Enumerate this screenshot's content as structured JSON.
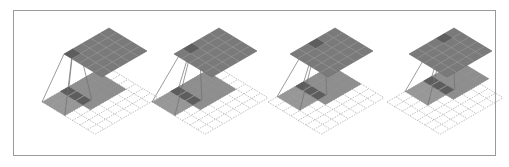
{
  "diagram": {
    "type": "convolution-animation-frames",
    "panel_count": 4,
    "output_grid": {
      "rows": 5,
      "cols": 5,
      "color": "#7a7a7a",
      "highlight_color": "#5e5e5e",
      "line_color": "#9a9a9a"
    },
    "input_grid": {
      "rows": 7,
      "cols": 7,
      "line_color": "#b0b0b0",
      "dashed": true
    },
    "kernel": {
      "size": 3,
      "fill": "#8c8c8c",
      "overlap_fill": "#5a5a5a"
    },
    "shaded_region": {
      "size": 4,
      "fill": "#7a7a7a"
    },
    "connector_color": "#707070",
    "frame_border": "#9a9a9a",
    "panels": [
      {
        "id": 1,
        "offset_x": 0,
        "kernel_col": 0,
        "kernel_row": 1,
        "output_col": 0,
        "output_row": 0
      },
      {
        "id": 2,
        "offset_x": 110,
        "kernel_col": 0,
        "kernel_row": 1,
        "output_col": 1,
        "output_row": 0
      },
      {
        "id": 3,
        "offset_x": 226,
        "kernel_col": 1,
        "kernel_row": 1,
        "output_col": 2,
        "output_row": 0
      },
      {
        "id": 4,
        "offset_x": 345,
        "kernel_col": 2,
        "kernel_row": 1,
        "output_col": 3,
        "output_row": 0
      }
    ]
  }
}
